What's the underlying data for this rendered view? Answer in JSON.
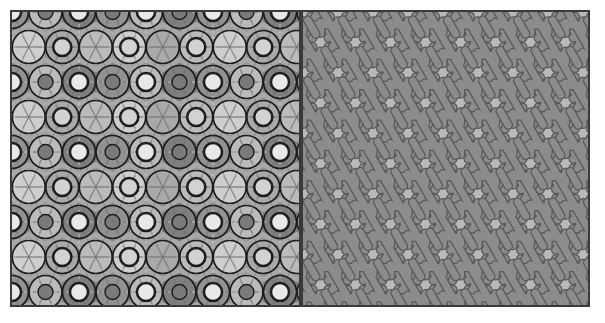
{
  "figure": {
    "panel_count": 2,
    "background_color": "#ffffff",
    "frame_color": "#3a3a3a",
    "frame_width_px": 2,
    "width_px": 605,
    "height_px": 323
  },
  "panels": [
    {
      "id": "left",
      "name": "construction-panel",
      "label": "",
      "x": 10,
      "y": 10,
      "width": 291,
      "height": 297,
      "background_color": "#a8a8a8",
      "repeat_period_x_px": 67,
      "repeat_period_y_px": 70,
      "symmetry": "p6m hexagonal",
      "elements": [
        "overlapping-circles",
        "shaded-polygon-tiles",
        "dashed-symmetry-axes",
        "thin-grey-construction-lines",
        "heavy-black-rosette-outlines"
      ],
      "fill_palette": {
        "lightest": "#e8e8e8",
        "light": "#d2d2d2",
        "mid": "#bcbcbc",
        "base": "#a8a8a8",
        "dark": "#8f8f8f",
        "darkest": "#7a7a7a"
      },
      "line_colors": {
        "heavy_outline": "#1c1c1c",
        "thin_construction": "#6e6e6e",
        "dashed_axis": "#cfcfcf"
      }
    },
    {
      "id": "right",
      "name": "strapwork-panel",
      "label": "",
      "x": 301,
      "y": 10,
      "width": 289,
      "height": 297,
      "background_color": "#b9b9b9",
      "repeat_period_x_px": 70,
      "repeat_period_y_px": 70,
      "symmetry": "p6m hexagonal",
      "elements": [
        "interlaced-strapwork",
        "six-pointed-star-voids",
        "hexagonal-voids"
      ],
      "strap_color": "#8c8c8c",
      "strap_edge_color": "#5a5a5a",
      "strap_width_px": 7
    }
  ],
  "divider": {
    "name": "panel-divider",
    "x_px": 301,
    "color": "#3a3a3a",
    "width_px": 2
  }
}
